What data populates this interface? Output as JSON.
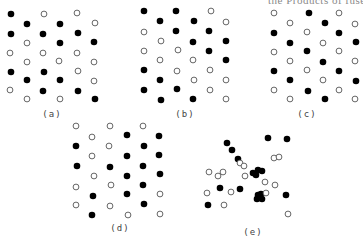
{
  "header": {
    "clipped_text": "the Products of fuse"
  },
  "style": {
    "filled_color": "#000000",
    "hollow_stroke": "#555555",
    "radius": 3.3
  },
  "panels": [
    {
      "id": "a",
      "label": "(a)",
      "label_pos": [
        52,
        115
      ],
      "black": [
        [
          11,
          14
        ],
        [
          27,
          24
        ],
        [
          60,
          24
        ],
        [
          11,
          34
        ],
        [
          43,
          34
        ],
        [
          78,
          33
        ],
        [
          60,
          43
        ],
        [
          94,
          42
        ],
        [
          11,
          72
        ],
        [
          44,
          72
        ],
        [
          27,
          80
        ],
        [
          60,
          80
        ],
        [
          43,
          91
        ],
        [
          78,
          91
        ],
        [
          95,
          99
        ]
      ],
      "white": [
        [
          44,
          14
        ],
        [
          77,
          13
        ],
        [
          95,
          23
        ],
        [
          27,
          43
        ],
        [
          10,
          53
        ],
        [
          43,
          53
        ],
        [
          77,
          53
        ],
        [
          27,
          62
        ],
        [
          59,
          61
        ],
        [
          94,
          62
        ],
        [
          78,
          71
        ],
        [
          94,
          81
        ],
        [
          10,
          90
        ],
        [
          27,
          99
        ],
        [
          60,
          99
        ]
      ]
    },
    {
      "id": "b",
      "label": "(b)",
      "label_pos": [
        185,
        115
      ],
      "black": [
        [
          144,
          11
        ],
        [
          176,
          11
        ],
        [
          160,
          21
        ],
        [
          194,
          21
        ],
        [
          176,
          31
        ],
        [
          209,
          31
        ],
        [
          193,
          42
        ],
        [
          226,
          41
        ],
        [
          209,
          51
        ],
        [
          226,
          60
        ],
        [
          144,
          70
        ],
        [
          160,
          80
        ],
        [
          144,
          90
        ],
        [
          177,
          89
        ],
        [
          161,
          100
        ],
        [
          193,
          99
        ]
      ],
      "white": [
        [
          211,
          11
        ],
        [
          226,
          22
        ],
        [
          144,
          32
        ],
        [
          161,
          41
        ],
        [
          144,
          51
        ],
        [
          178,
          50
        ],
        [
          160,
          60
        ],
        [
          193,
          60
        ],
        [
          177,
          71
        ],
        [
          210,
          70
        ],
        [
          194,
          80
        ],
        [
          226,
          80
        ],
        [
          210,
          90
        ],
        [
          226,
          99
        ]
      ]
    },
    {
      "id": "c",
      "label": "(c)",
      "label_pos": [
        307,
        115
      ],
      "black": [
        [
          309,
          13
        ],
        [
          325,
          23
        ],
        [
          274,
          33
        ],
        [
          339,
          33
        ],
        [
          290,
          43
        ],
        [
          356,
          42
        ],
        [
          307,
          51
        ],
        [
          323,
          62
        ],
        [
          274,
          71
        ],
        [
          339,
          71
        ],
        [
          290,
          80
        ],
        [
          356,
          81
        ],
        [
          308,
          91
        ],
        [
          325,
          99
        ]
      ],
      "white": [
        [
          274,
          13
        ],
        [
          339,
          13
        ],
        [
          290,
          23
        ],
        [
          355,
          24
        ],
        [
          307,
          32
        ],
        [
          323,
          43
        ],
        [
          274,
          52
        ],
        [
          339,
          51
        ],
        [
          290,
          61
        ],
        [
          355,
          61
        ],
        [
          307,
          70
        ],
        [
          323,
          80
        ],
        [
          274,
          90
        ],
        [
          339,
          90
        ],
        [
          290,
          99
        ],
        [
          355,
          99
        ]
      ]
    },
    {
      "id": "d",
      "label": "(d)",
      "label_pos": [
        120,
        229
      ],
      "black": [
        [
          127,
          135
        ],
        [
          159,
          136
        ],
        [
          76,
          146
        ],
        [
          144,
          146
        ],
        [
          127,
          156
        ],
        [
          159,
          155
        ],
        [
          77,
          166
        ],
        [
          110,
          167
        ],
        [
          143,
          166
        ],
        [
          127,
          176
        ],
        [
          160,
          174
        ],
        [
          143,
          185
        ],
        [
          93,
          196
        ],
        [
          127,
          194
        ],
        [
          144,
          204
        ],
        [
          92,
          215
        ]
      ],
      "white": [
        [
          76,
          126
        ],
        [
          110,
          126
        ],
        [
          143,
          126
        ],
        [
          92,
          137
        ],
        [
          109,
          146
        ],
        [
          92,
          156
        ],
        [
          94,
          176
        ],
        [
          76,
          187
        ],
        [
          111,
          185
        ],
        [
          160,
          194
        ],
        [
          76,
          205
        ],
        [
          110,
          206
        ],
        [
          128,
          215
        ],
        [
          160,
          214
        ]
      ]
    },
    {
      "id": "e",
      "label": "(e)",
      "label_pos": [
        253,
        233
      ],
      "black": [
        [
          268,
          138
        ],
        [
          287,
          139
        ],
        [
          227,
          143
        ],
        [
          232,
          150
        ],
        [
          238,
          159
        ],
        [
          253,
          173
        ],
        [
          258,
          170
        ],
        [
          262,
          171
        ],
        [
          256,
          175
        ],
        [
          220,
          188
        ],
        [
          240,
          189
        ],
        [
          258,
          195
        ],
        [
          261,
          194
        ],
        [
          257,
          199
        ],
        [
          262,
          199
        ],
        [
          286,
          195
        ],
        [
          208,
          205
        ]
      ],
      "white": [
        [
          274,
          158
        ],
        [
          279,
          157
        ],
        [
          240,
          163
        ],
        [
          244,
          166
        ],
        [
          209,
          172
        ],
        [
          218,
          176
        ],
        [
          223,
          172
        ],
        [
          245,
          176
        ],
        [
          265,
          182
        ],
        [
          275,
          185
        ],
        [
          207,
          193
        ],
        [
          231,
          192
        ],
        [
          266,
          193
        ],
        [
          224,
          205
        ],
        [
          288,
          214
        ]
      ]
    }
  ]
}
